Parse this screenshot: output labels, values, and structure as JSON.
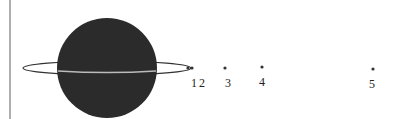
{
  "diagram": {
    "type": "planet-with-ring-and-moons",
    "colors": {
      "planet": "#2b2b2b",
      "ring": "#333333",
      "axis": "#777777",
      "dot": "#333333",
      "background": "#ffffff"
    },
    "planet": {
      "cx": 107,
      "cy": 68,
      "r": 50
    },
    "ring": {
      "cx": 107,
      "cy": 68,
      "rx": 84,
      "ry": 7
    },
    "moons": [
      {
        "label": "1",
        "x": 188,
        "y": 68,
        "label_x": 191
      },
      {
        "label": "2",
        "x": 192,
        "y": 68,
        "label_x": 199
      },
      {
        "label": "3",
        "x": 225,
        "y": 68,
        "label_x": 225
      },
      {
        "label": "4",
        "x": 262,
        "y": 67,
        "label_x": 259
      },
      {
        "label": "5",
        "x": 373,
        "y": 69,
        "label_x": 369
      }
    ]
  }
}
